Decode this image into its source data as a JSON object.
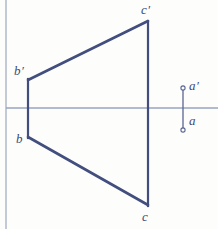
{
  "figure": {
    "type": "descriptive-geometry-projection",
    "canvas": {
      "width": 218,
      "height": 229
    },
    "colors": {
      "background": "#fdfdfc",
      "line_stroke": "#414e7e",
      "axis_stroke": "#98a3c0",
      "frame_stroke": "#a9b2c8",
      "label_text": "#3d4a78",
      "point_marker_stroke": "#5a6694"
    },
    "axis": {
      "name": "ground-line-xy",
      "orientation": "horizontal",
      "y": 108,
      "x_start": 6,
      "x_end": 218,
      "stroke_width": 1.6
    },
    "frame": {
      "name": "left-frame-border",
      "orientation": "vertical",
      "x": 6,
      "y_start": 0,
      "y_end": 229,
      "stroke_width": 1.4
    },
    "points": [
      {
        "id": "b-prime",
        "label": "b",
        "prime": true,
        "x": 28,
        "y": 80,
        "label_x": 14,
        "label_y": 64
      },
      {
        "id": "b",
        "label": "b",
        "prime": false,
        "x": 28,
        "y": 137,
        "label_x": 16,
        "label_y": 132
      },
      {
        "id": "c-prime",
        "label": "c",
        "prime": true,
        "x": 148,
        "y": 21,
        "label_x": 141,
        "label_y": 3
      },
      {
        "id": "c",
        "label": "c",
        "prime": false,
        "x": 148,
        "y": 205,
        "label_x": 142,
        "label_y": 210
      },
      {
        "id": "a-prime",
        "label": "a",
        "prime": true,
        "x": 183,
        "y": 88,
        "label_x": 189,
        "label_y": 79
      },
      {
        "id": "a",
        "label": "a",
        "prime": false,
        "x": 183,
        "y": 130,
        "label_x": 189,
        "label_y": 114
      }
    ],
    "segments": [
      {
        "name": "segment-b-prime-to-c-prime",
        "from": "b-prime",
        "x1": 28,
        "y1": 80,
        "x2": 148,
        "y2": 21,
        "stroke_width": 2.6,
        "style": "solid"
      },
      {
        "name": "segment-b-to-c",
        "from": "b",
        "x1": 28,
        "y1": 137,
        "x2": 148,
        "y2": 205,
        "stroke_width": 2.6,
        "style": "solid"
      },
      {
        "name": "projector-b-prime-b",
        "from": "b-prime",
        "x1": 28,
        "y1": 79,
        "x2": 28,
        "y2": 138,
        "stroke_width": 2.2,
        "style": "solid"
      },
      {
        "name": "projector-c-prime-c",
        "from": "c-prime",
        "x1": 148,
        "y1": 21,
        "x2": 148,
        "y2": 206,
        "stroke_width": 2.2,
        "style": "solid"
      },
      {
        "name": "projector-a-prime-a",
        "from": "a-prime",
        "x1": 183,
        "y1": 89,
        "x2": 183,
        "y2": 129,
        "stroke_width": 1.3,
        "style": "solid"
      }
    ],
    "markers": [
      {
        "name": "point-marker-a-prime",
        "cx": 183,
        "cy": 88,
        "r": 2.1
      },
      {
        "name": "point-marker-a",
        "cx": 183,
        "cy": 130,
        "r": 2.1
      }
    ],
    "labels": {
      "b_prime": "b",
      "b": "b",
      "c_prime": "c",
      "c": "c",
      "a_prime": "a",
      "a": "a",
      "prime_glyph": "′"
    }
  }
}
